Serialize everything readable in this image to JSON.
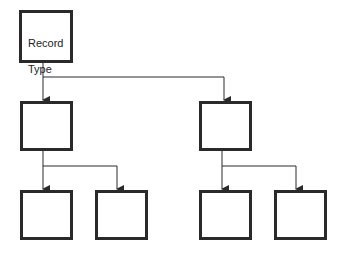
{
  "diagram": {
    "type": "hierarchy-tree",
    "root": {
      "label_line1": "Record",
      "label_line2": "Type"
    },
    "levels": [
      {
        "level": 1,
        "nodes": [
          "child-left",
          "child-right"
        ]
      },
      {
        "level": 2,
        "nodes": [
          "grandchild-left-1",
          "grandchild-left-2",
          "grandchild-right-1",
          "grandchild-right-2"
        ]
      }
    ],
    "node_labels": {
      "child-left": "",
      "child-right": "",
      "grandchild-left-1": "",
      "grandchild-left-2": "",
      "grandchild-right-1": "",
      "grandchild-right-2": ""
    },
    "colors": {
      "stroke": "#2a2a2a",
      "background": "#ffffff"
    }
  }
}
